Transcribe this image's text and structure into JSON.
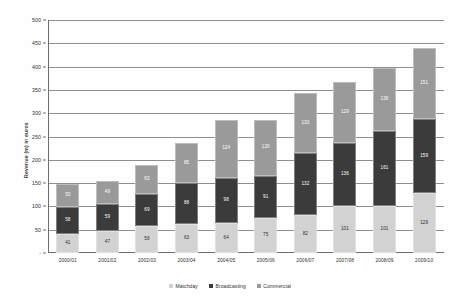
{
  "chart_data": {
    "type": "bar",
    "stacked": true,
    "title": "",
    "subtitle": "",
    "xlabel": "",
    "ylabel": "Revenue (m) in euros",
    "ylim": [
      0,
      500
    ],
    "ytick_step": 50,
    "yticks": [
      "-",
      "50",
      "100",
      "150",
      "200",
      "250",
      "300",
      "350",
      "400",
      "450",
      "500"
    ],
    "grid": true,
    "legend_position": "bottom",
    "categories": [
      "2000/01",
      "2001/02",
      "2002/03",
      "2003/04",
      "2004/05",
      "2005/06",
      "2006/07",
      "2007/08",
      "2008/09",
      "2009/10"
    ],
    "series": [
      {
        "name": "Matchday",
        "color": "#d2d2d2",
        "values": [
          41,
          47,
          58,
          63,
          64,
          75,
          82,
          101,
          101,
          129
        ]
      },
      {
        "name": "Broadcasting",
        "color": "#3b3b3b",
        "values": [
          58,
          59,
          69,
          88,
          98,
          91,
          132,
          136,
          161,
          159
        ]
      },
      {
        "name": "Commercial",
        "color": "#9a9a9a",
        "values": [
          50,
          49,
          63,
          85,
          124,
          120,
          130,
          129,
          136,
          151
        ]
      }
    ],
    "totals": [
      149,
      155,
      190,
      236,
      286,
      286,
      344,
      366,
      398,
      439
    ]
  },
  "legend": {
    "items": [
      {
        "label": "Matchday",
        "key": "matchday"
      },
      {
        "label": "Broadcasting",
        "key": "broadcasting"
      },
      {
        "label": "Commercial",
        "key": "commercial"
      }
    ]
  }
}
